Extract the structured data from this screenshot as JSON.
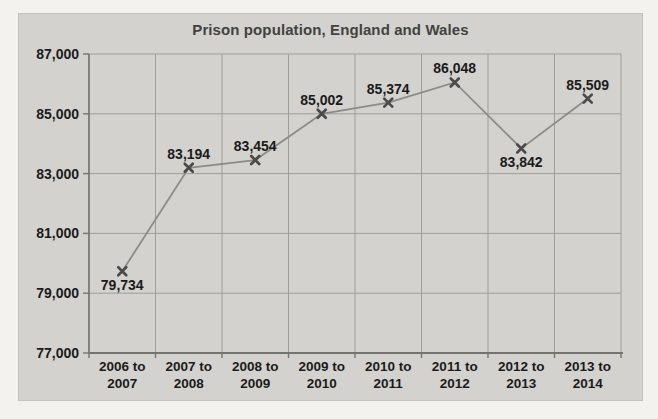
{
  "chart_data": {
    "type": "line",
    "title": "Prison population, England and Wales",
    "categories": [
      "2006 to 2007",
      "2007 to 2008",
      "2008 to 2009",
      "2009 to 2010",
      "2010 to 2011",
      "2011 to 2012",
      "2012 to 2013",
      "2013 to 2014"
    ],
    "values": [
      79734,
      83194,
      83454,
      85002,
      85374,
      86048,
      83842,
      85509
    ],
    "data_labels": [
      "79,734",
      "83,194",
      "83,454",
      "85,002",
      "85,374",
      "86,048",
      "83,842",
      "85,509"
    ],
    "label_placement": [
      "below",
      "above",
      "above",
      "above",
      "above",
      "above",
      "below",
      "above"
    ],
    "xlabel": "",
    "ylabel": "",
    "ylim": [
      77000,
      87000
    ],
    "ytick_interval": 2000,
    "ytick_labels": [
      "77,000",
      "79,000",
      "81,000",
      "83,000",
      "85,000",
      "87,000"
    ],
    "grid": "both",
    "legend": "none",
    "marker": "x"
  },
  "colors": {
    "page_bg": "#f3f2ef",
    "chart_bg": "#d3d2ce",
    "gridline": "#9e9e98",
    "axis": "#74746f",
    "series_line": "#8b8b87",
    "marker": "#4a4a4a",
    "text": "#1b1b1b",
    "title": "#424242"
  }
}
